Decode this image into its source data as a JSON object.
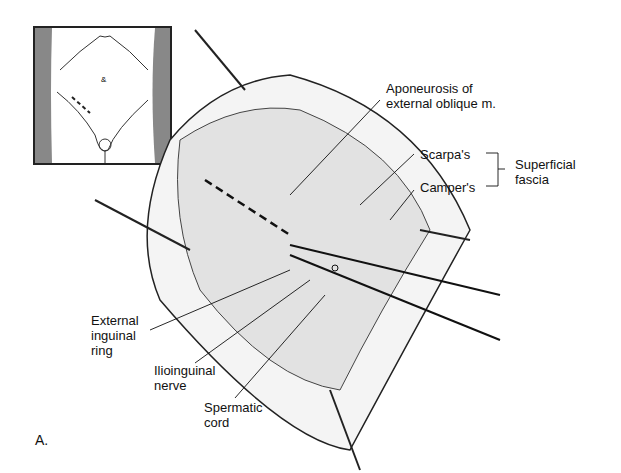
{
  "figure": {
    "panel_label": "A.",
    "labels": {
      "aponeurosis": "Aponeurosis of\nexternal oblique m.",
      "scarpas": "Scarpa's",
      "campers": "Camper's",
      "superficial_fascia": "Superficial\nfascia",
      "external_inguinal_ring": "External\ninguinal\nring",
      "ilioinguinal_nerve": "Ilioinguinal\nnerve",
      "spermatic_cord": "Spermatic\ncord"
    }
  }
}
